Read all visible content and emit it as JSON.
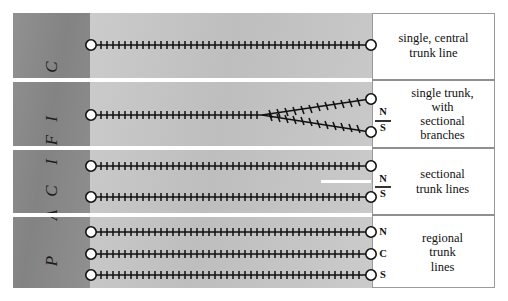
{
  "figure": {
    "side_label": {
      "text": "PACIFIC",
      "letters": [
        "C",
        "I",
        "F",
        "I",
        "C",
        "A",
        "P"
      ],
      "orientation": "vertical-rotated"
    },
    "colors": {
      "band_dark": "#8a8a8a",
      "band_mid": "#c8c8c8",
      "band_light": "#ffffff",
      "separator": "#ffffff",
      "track": "#111111",
      "node_fill": "#ffffff",
      "border": "#9a9a9a"
    },
    "rows": [
      {
        "id": "row-1",
        "caption": "single, central trunk line",
        "caption_lines": [
          "single, central",
          "trunk line"
        ],
        "pattern": "single-line",
        "tracks": 1,
        "direction_labels": []
      },
      {
        "id": "row-2",
        "caption": "single trunk, with sectional branches",
        "caption_lines": [
          "single trunk,",
          "with",
          "sectional",
          "branches"
        ],
        "pattern": "forked-line",
        "tracks": 1,
        "branches": 2,
        "direction_labels": [
          "N",
          "S"
        ]
      },
      {
        "id": "row-3",
        "caption": "sectional trunk lines",
        "caption_lines": [
          "sectional",
          "trunk lines"
        ],
        "pattern": "parallel-lines",
        "tracks": 2,
        "direction_labels": [
          "N",
          "S"
        ]
      },
      {
        "id": "row-4",
        "caption": "regional trunk lines",
        "caption_lines": [
          "regional",
          "trunk",
          "lines"
        ],
        "pattern": "parallel-lines",
        "tracks": 3,
        "direction_labels": [
          "N",
          "C",
          "S"
        ]
      }
    ]
  }
}
